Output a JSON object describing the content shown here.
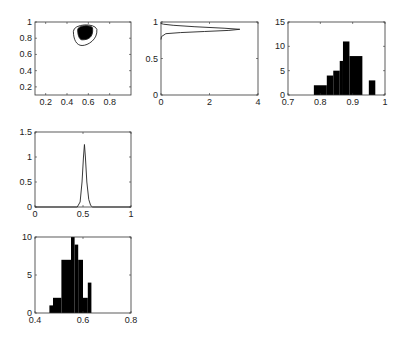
{
  "chart_data": [
    {
      "id": "joint-contour",
      "type": "contour",
      "title": "",
      "xlabel": "",
      "ylabel": "",
      "xlim": [
        0.1,
        1.0
      ],
      "ylim": [
        0.1,
        1.0
      ],
      "xticks": [
        "0.2",
        "0.4",
        "0.6",
        "0.8"
      ],
      "yticks": [
        "0.2",
        "0.4",
        "0.6",
        "0.8",
        "1"
      ],
      "contours": [
        {
          "level": "outer",
          "fill": "none",
          "center": [
            0.56,
            0.86
          ],
          "x_extent": [
            0.46,
            0.68
          ],
          "y_extent": [
            0.71,
            0.98
          ]
        },
        {
          "level": "inner",
          "fill": "black",
          "center": [
            0.56,
            0.88
          ],
          "x_extent": [
            0.5,
            0.64
          ],
          "y_extent": [
            0.78,
            0.96
          ]
        }
      ]
    },
    {
      "id": "marginal-density-y",
      "type": "line",
      "orientation": "horizontal",
      "xlim": [
        0,
        4
      ],
      "ylim": [
        0,
        1
      ],
      "xticks": [
        "0",
        "2",
        "4"
      ],
      "yticks": [
        "0",
        "0.5",
        "1"
      ],
      "x": [
        0,
        0.02,
        0.2,
        0.8,
        1.8,
        2.8,
        3.25,
        2.6,
        1.4,
        0.5,
        0.1,
        0
      ],
      "y": [
        0.76,
        0.8,
        0.84,
        0.855,
        0.87,
        0.885,
        0.9,
        0.915,
        0.935,
        0.955,
        0.97,
        0.98
      ]
    },
    {
      "id": "histogram-upper",
      "type": "bar",
      "xlim": [
        0.7,
        1.0
      ],
      "ylim": [
        0,
        15
      ],
      "xticks": [
        "0.7",
        "0.8",
        "0.9",
        "1"
      ],
      "yticks": [
        "0",
        "5",
        "10",
        "15"
      ],
      "bins": [
        {
          "x0": 0.78,
          "x1": 0.82,
          "count": 2
        },
        {
          "x0": 0.82,
          "x1": 0.84,
          "count": 4
        },
        {
          "x0": 0.84,
          "x1": 0.86,
          "count": 5
        },
        {
          "x0": 0.86,
          "x1": 0.87,
          "count": 7
        },
        {
          "x0": 0.87,
          "x1": 0.89,
          "count": 11
        },
        {
          "x0": 0.89,
          "x1": 0.93,
          "count": 8
        },
        {
          "x0": 0.95,
          "x1": 0.97,
          "count": 3
        }
      ]
    },
    {
      "id": "marginal-density-x",
      "type": "line",
      "xlim": [
        0,
        1
      ],
      "ylim": [
        0,
        1.5
      ],
      "xticks": [
        "0",
        "0.5",
        "1"
      ],
      "yticks": [
        "0",
        "0.5",
        "1",
        "1.5"
      ],
      "x": [
        0,
        0.44,
        0.47,
        0.49,
        0.505,
        0.515,
        0.525,
        0.54,
        0.56,
        0.58,
        0.6,
        1
      ],
      "y": [
        0,
        0,
        0.1,
        0.5,
        1.0,
        1.25,
        1.0,
        0.5,
        0.15,
        0.03,
        0,
        0
      ]
    },
    {
      "id": "histogram-lower",
      "type": "bar",
      "xlim": [
        0.4,
        0.8
      ],
      "ylim": [
        0,
        10
      ],
      "xticks": [
        "0.4",
        "0.6",
        "0.8"
      ],
      "yticks": [
        "0",
        "5",
        "10"
      ],
      "bins": [
        {
          "x0": 0.46,
          "x1": 0.475,
          "count": 1
        },
        {
          "x0": 0.475,
          "x1": 0.51,
          "count": 2
        },
        {
          "x0": 0.51,
          "x1": 0.55,
          "count": 7
        },
        {
          "x0": 0.55,
          "x1": 0.565,
          "count": 10
        },
        {
          "x0": 0.565,
          "x1": 0.58,
          "count": 9
        },
        {
          "x0": 0.58,
          "x1": 0.6,
          "count": 7
        },
        {
          "x0": 0.6,
          "x1": 0.62,
          "count": 2
        },
        {
          "x0": 0.62,
          "x1": 0.635,
          "count": 4
        }
      ]
    }
  ],
  "layout": {
    "panels": [
      {
        "left": 35,
        "top": 22,
        "width": 96,
        "height": 73
      },
      {
        "left": 161,
        "top": 22,
        "width": 97,
        "height": 73
      },
      {
        "left": 288,
        "top": 22,
        "width": 97,
        "height": 73
      },
      {
        "left": 35,
        "top": 132,
        "width": 96,
        "height": 75
      },
      {
        "left": 35,
        "top": 237,
        "width": 96,
        "height": 76
      }
    ],
    "colors": {
      "axis": "#333333",
      "fill": "#000000",
      "line": "#222222"
    }
  }
}
